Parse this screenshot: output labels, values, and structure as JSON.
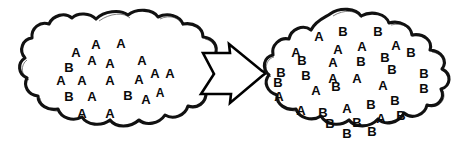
{
  "diagram": {
    "type": "population-shift-diagram",
    "title": "",
    "background_color": "#ffffff",
    "ink_color": "#111111",
    "letter_color": "#0a0a0a",
    "arrow": {
      "name": "block-arrow-right",
      "direction": "right",
      "label": "",
      "fill": "#ffffff",
      "stroke": "#000000"
    },
    "left_cloud": {
      "name": "left-population-cloud",
      "label": "",
      "counts": {
        "A": 16,
        "B": 3,
        "total": 19
      },
      "letters": [
        {
          "char": "A",
          "x": 76,
          "y": 52,
          "size": 13
        },
        {
          "char": "A",
          "x": 96,
          "y": 44,
          "size": 13
        },
        {
          "char": "A",
          "x": 121,
          "y": 43,
          "size": 13
        },
        {
          "char": "B",
          "x": 69,
          "y": 67,
          "size": 13
        },
        {
          "char": "A",
          "x": 92,
          "y": 60,
          "size": 13
        },
        {
          "char": "A",
          "x": 110,
          "y": 63,
          "size": 13
        },
        {
          "char": "A",
          "x": 142,
          "y": 60,
          "size": 13
        },
        {
          "char": "A",
          "x": 61,
          "y": 80,
          "size": 13
        },
        {
          "char": "A",
          "x": 82,
          "y": 80,
          "size": 13
        },
        {
          "char": "A",
          "x": 110,
          "y": 80,
          "size": 13
        },
        {
          "char": "A",
          "x": 139,
          "y": 79,
          "size": 13
        },
        {
          "char": "A",
          "x": 155,
          "y": 73,
          "size": 13
        },
        {
          "char": "A",
          "x": 170,
          "y": 73,
          "size": 13
        },
        {
          "char": "B",
          "x": 69,
          "y": 96,
          "size": 13
        },
        {
          "char": "A",
          "x": 92,
          "y": 96,
          "size": 13
        },
        {
          "char": "B",
          "x": 128,
          "y": 95,
          "size": 13
        },
        {
          "char": "A",
          "x": 146,
          "y": 99,
          "size": 13
        },
        {
          "char": "A",
          "x": 160,
          "y": 93,
          "size": 12
        },
        {
          "char": "A",
          "x": 82,
          "y": 113,
          "size": 13
        },
        {
          "char": "A",
          "x": 110,
          "y": 113,
          "size": 13
        }
      ]
    },
    "right_cloud": {
      "name": "right-population-cloud",
      "label": "",
      "counts": {
        "A": 15,
        "B": 20,
        "total": 35
      },
      "letters": [
        {
          "char": "A",
          "x": 319,
          "y": 36,
          "size": 13
        },
        {
          "char": "B",
          "x": 343,
          "y": 31,
          "size": 13
        },
        {
          "char": "B",
          "x": 378,
          "y": 31,
          "size": 13
        },
        {
          "char": "A",
          "x": 296,
          "y": 52,
          "size": 13
        },
        {
          "char": "A",
          "x": 338,
          "y": 49,
          "size": 13
        },
        {
          "char": "A",
          "x": 362,
          "y": 46,
          "size": 13
        },
        {
          "char": "A",
          "x": 396,
          "y": 45,
          "size": 13
        },
        {
          "char": "B",
          "x": 411,
          "y": 52,
          "size": 13
        },
        {
          "char": "B",
          "x": 302,
          "y": 60,
          "size": 13
        },
        {
          "char": "A",
          "x": 333,
          "y": 62,
          "size": 13
        },
        {
          "char": "B",
          "x": 361,
          "y": 61,
          "size": 13
        },
        {
          "char": "B",
          "x": 385,
          "y": 57,
          "size": 13
        },
        {
          "char": "B",
          "x": 392,
          "y": 69,
          "size": 13
        },
        {
          "char": "B",
          "x": 281,
          "y": 72,
          "size": 13
        },
        {
          "char": "B",
          "x": 306,
          "y": 75,
          "size": 13
        },
        {
          "char": "A",
          "x": 333,
          "y": 78,
          "size": 13
        },
        {
          "char": "B",
          "x": 424,
          "y": 73,
          "size": 13
        },
        {
          "char": "B",
          "x": 278,
          "y": 82,
          "size": 13
        },
        {
          "char": "B",
          "x": 336,
          "y": 86,
          "size": 13
        },
        {
          "char": "A",
          "x": 357,
          "y": 78,
          "size": 13
        },
        {
          "char": "A",
          "x": 383,
          "y": 85,
          "size": 13
        },
        {
          "char": "B",
          "x": 424,
          "y": 88,
          "size": 13
        },
        {
          "char": "A",
          "x": 279,
          "y": 96,
          "size": 13
        },
        {
          "char": "A",
          "x": 316,
          "y": 90,
          "size": 13
        },
        {
          "char": "A",
          "x": 301,
          "y": 110,
          "size": 13
        },
        {
          "char": "B",
          "x": 323,
          "y": 112,
          "size": 13
        },
        {
          "char": "A",
          "x": 347,
          "y": 108,
          "size": 13
        },
        {
          "char": "B",
          "x": 371,
          "y": 104,
          "size": 13
        },
        {
          "char": "B",
          "x": 395,
          "y": 100,
          "size": 13
        },
        {
          "char": "B",
          "x": 401,
          "y": 115,
          "size": 13
        },
        {
          "char": "B",
          "x": 330,
          "y": 123,
          "size": 13
        },
        {
          "char": "B",
          "x": 357,
          "y": 122,
          "size": 13
        },
        {
          "char": "A",
          "x": 381,
          "y": 118,
          "size": 13
        },
        {
          "char": "B",
          "x": 347,
          "y": 133,
          "size": 13
        },
        {
          "char": "B",
          "x": 372,
          "y": 131,
          "size": 13
        }
      ]
    }
  }
}
